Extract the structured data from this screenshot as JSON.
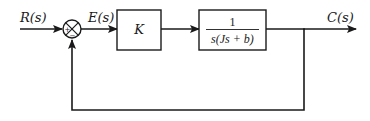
{
  "diagram": {
    "type": "feedback-control-block-diagram",
    "signals": {
      "input": "R(s)",
      "error": "E(s)",
      "output": "C(s)"
    },
    "summing_junction": {
      "plus_sign": "+",
      "minus_sign": "−"
    },
    "blocks": [
      {
        "id": "controller",
        "label": "K"
      },
      {
        "id": "plant",
        "numerator": "1",
        "denominator": "s(Js + b)"
      }
    ],
    "feedback": "unity negative feedback",
    "colors": {
      "line": "#1a1a1a",
      "background": "#ffffff"
    }
  }
}
